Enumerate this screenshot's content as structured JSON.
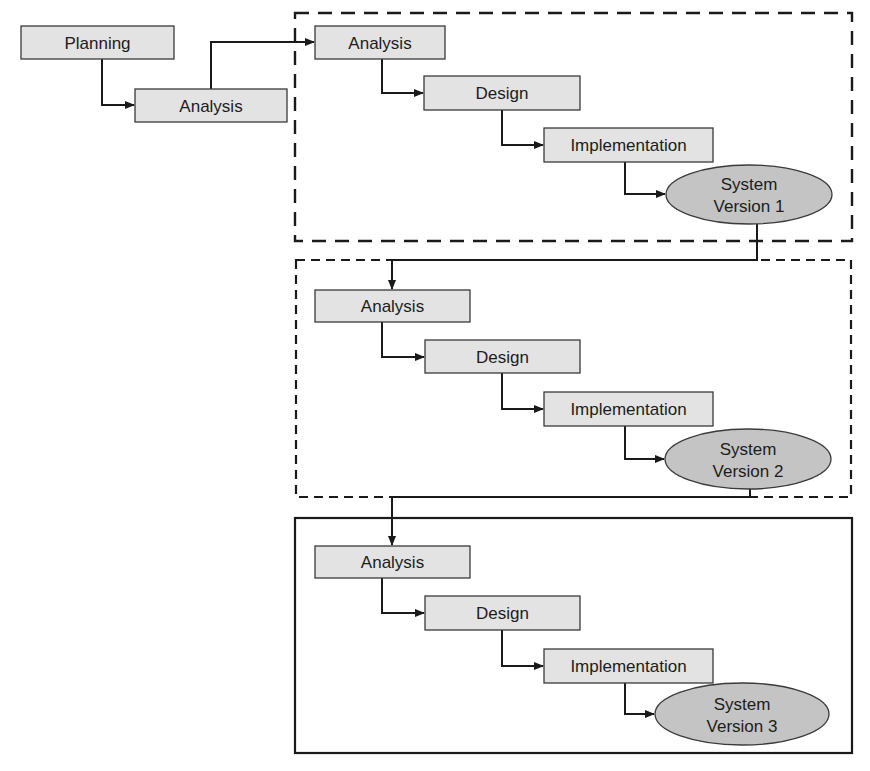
{
  "diagram": {
    "type": "iterative-development-flow",
    "colors": {
      "box_fill": "#e3e3e3",
      "ellipse_fill": "#c4c4c4",
      "stroke": "#1a1a1a"
    },
    "preliminary": {
      "planning": "Planning",
      "analysis": "Analysis"
    },
    "iterations": [
      {
        "frame_style": "long-dash",
        "analysis": "Analysis",
        "design": "Design",
        "implementation": "Implementation",
        "system_line1": "System",
        "system_line2": "Version 1"
      },
      {
        "frame_style": "short-dash",
        "analysis": "Analysis",
        "design": "Design",
        "implementation": "Implementation",
        "system_line1": "System",
        "system_line2": "Version 2"
      },
      {
        "frame_style": "solid",
        "analysis": "Analysis",
        "design": "Design",
        "implementation": "Implementation",
        "system_line1": "System",
        "system_line2": "Version 3"
      }
    ]
  }
}
